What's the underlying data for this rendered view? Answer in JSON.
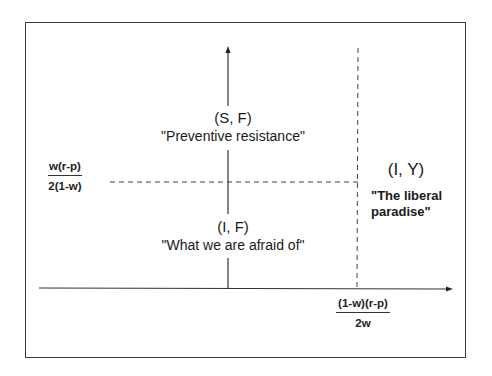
{
  "diagram": {
    "type": "quadrant-diagram",
    "axes": {
      "x_threshold": {
        "numerator": "(1-w)(r-p)",
        "denominator": "2w"
      },
      "y_threshold": {
        "numerator": "w(r-p)",
        "denominator": "2(1-w)"
      }
    },
    "regions": [
      {
        "pair": "(S, F)",
        "label": "\"Preventive resistance\""
      },
      {
        "pair": "(I, F)",
        "label": "\"What we are afraid of\""
      },
      {
        "pair": "(I, Y)",
        "label_line1": "\"The liberal",
        "label_line2": "paradise\""
      }
    ],
    "colors": {
      "line": "#333333",
      "text": "#1a1a1a",
      "background": "#ffffff"
    }
  }
}
